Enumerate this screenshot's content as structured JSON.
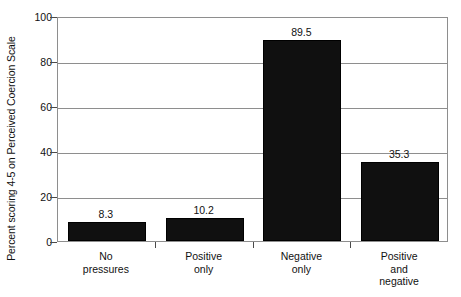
{
  "chart_data": {
    "type": "bar",
    "title": "",
    "subtitle": "",
    "xlabel": "",
    "ylabel": "Percent scoring 4-5 on Perceived Coercion Scale",
    "categories": [
      "No pressures",
      "Positive only",
      "Negative only",
      "Positive and negative"
    ],
    "category_lines": [
      [
        "No",
        "pressures"
      ],
      [
        "Positive",
        "only"
      ],
      [
        "Negative",
        "only"
      ],
      [
        "Positive",
        "and",
        "negative"
      ]
    ],
    "values": [
      8.3,
      10.2,
      89.5,
      35.3
    ],
    "value_labels": [
      "8.3",
      "10.2",
      "89.5",
      "35.3"
    ],
    "ylim": [
      0,
      100
    ],
    "yticks": [
      0,
      20,
      40,
      60,
      80,
      100
    ],
    "ytick_labels": [
      "0",
      "20",
      "40",
      "60",
      "80",
      "100"
    ],
    "grid": true,
    "grid_axis": "y",
    "legend": false,
    "legend_position": "none",
    "bar_color": "#101010",
    "grid_color": "#8e8e8e",
    "axis_color": "#4a4a4a",
    "background_color": "#ffffff",
    "text_color": "#111111"
  }
}
